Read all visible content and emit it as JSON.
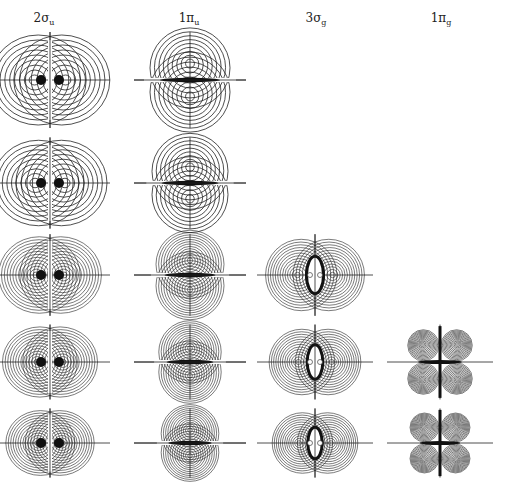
{
  "figure": {
    "columns": [
      {
        "symbol": "2σ",
        "subscript": "u",
        "type": "sigma-u"
      },
      {
        "symbol": "1π",
        "subscript": "u",
        "type": "pi-u"
      },
      {
        "symbol": "3σ",
        "subscript": "g",
        "type": "sigma-g"
      },
      {
        "symbol": "1π",
        "subscript": "g",
        "type": "pi-g"
      }
    ],
    "rows": 5,
    "panels_present": [
      [
        true,
        true,
        false,
        false
      ],
      [
        true,
        true,
        false,
        false
      ],
      [
        true,
        true,
        true,
        false
      ],
      [
        true,
        true,
        true,
        true
      ],
      [
        true,
        true,
        true,
        true
      ]
    ],
    "line_color": "#222222"
  }
}
